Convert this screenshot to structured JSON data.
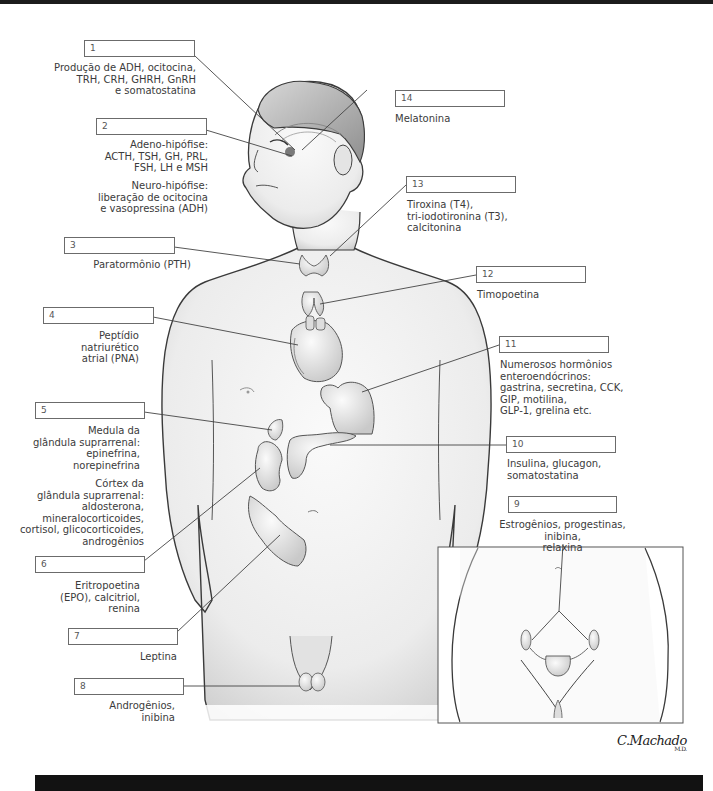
{
  "figure": {
    "signature": "C.Machado",
    "signature_suffix": "M.D."
  },
  "labels": [
    {
      "num": "1",
      "text": "Produção de ADH, ocitocina,\nTRH, CRH, GHRH, GnRH\ne somatostatina"
    },
    {
      "num": "2",
      "text": "Adeno-hipófise:\nACTH, TSH, GH, PRL,\nFSH, LH e MSH",
      "text2": "Neuro-hipófise:\nliberação de ocitocina\ne vasopressina (ADH)"
    },
    {
      "num": "3",
      "text": "Paratormônio (PTH)"
    },
    {
      "num": "4",
      "text": "Peptídio natriurético\natrial (PNA)"
    },
    {
      "num": "5",
      "text": "Medula da\nglândula suprarrenal:\nepinefrina,\nnorepinefrina",
      "text2": "Córtex da\nglândula suprarrenal:\naldosterona,\nmineralocorticoides,\ncortisol, glicocorticoides,\nandrogênios"
    },
    {
      "num": "6",
      "text": "Eritropoetina\n(EPO), calcitriol,\nrenina"
    },
    {
      "num": "7",
      "text": "Leptina"
    },
    {
      "num": "8",
      "text": "Androgênios,\ninibina"
    },
    {
      "num": "9",
      "text": "Estrogênios, progestinas, inibina,\nrelaxina"
    },
    {
      "num": "10",
      "text": "Insulina, glucagon,\nsomatostatina"
    },
    {
      "num": "11",
      "text": "Numerosos hormônios\nenteroendócrinos:\ngastrina, secretina, CCK,\nGIP, motilina,\nGLP-1, grelina etc."
    },
    {
      "num": "12",
      "text": "Timopoetina"
    },
    {
      "num": "13",
      "text": "Tiroxina (T4),\ntri-iodotironina (T3),\ncalcitonina"
    },
    {
      "num": "14",
      "text": "Melatonina"
    }
  ],
  "colors": {
    "outline": "#3a3a3a",
    "skin": "#f1f1f1",
    "shade": "#cfcfcf",
    "organ": "#e6e6e6",
    "leader": "#444444"
  }
}
